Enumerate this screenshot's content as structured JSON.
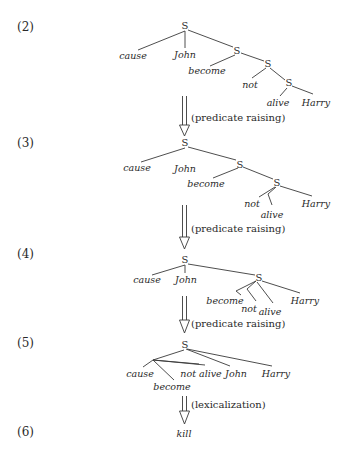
{
  "steps": [
    {
      "label": "(2)",
      "tree": {
        "nodes": [
          "S",
          "S",
          "S",
          "S"
        ],
        "leaves": [
          "cause",
          "John",
          "become",
          "not",
          "alive",
          "Harry"
        ]
      }
    },
    {
      "label": "(3)",
      "tree": {
        "nodes": [
          "S",
          "S",
          "S"
        ],
        "leaves": [
          "cause",
          "John",
          "become",
          "not",
          "alive",
          "Harry"
        ]
      }
    },
    {
      "label": "(4)",
      "tree": {
        "nodes": [
          "S",
          "S"
        ],
        "leaves": [
          "cause",
          "John",
          "become",
          "not",
          "alive",
          "Harry"
        ]
      }
    },
    {
      "label": "(5)",
      "tree": {
        "nodes": [
          "S"
        ],
        "leaves": [
          "cause",
          "become",
          "not alive",
          "John",
          "Harry"
        ]
      }
    },
    {
      "label": "(6)",
      "result": "kill"
    }
  ],
  "arrows": [
    {
      "label": "(predicate raising)"
    },
    {
      "label": "(predicate raising)"
    },
    {
      "label": "(predicate raising)"
    },
    {
      "label": "(lexicalization)"
    }
  ],
  "symbols": {
    "sentence_node": "S"
  }
}
